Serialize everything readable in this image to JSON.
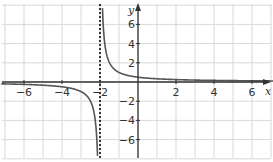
{
  "chart_data": {
    "type": "line",
    "title": "",
    "xlabel": "x",
    "ylabel": "y",
    "xlim": [
      -7,
      7
    ],
    "ylim": [
      -8,
      8
    ],
    "grid": true,
    "x_ticks": [
      -6,
      -4,
      -2,
      2,
      4,
      6
    ],
    "y_ticks": [
      -6,
      -4,
      -2,
      2,
      4,
      6
    ],
    "x_tick_labels": [
      "−6",
      "−4",
      "−2",
      "2",
      "4",
      "6"
    ],
    "y_tick_labels": [
      "−6",
      "−4",
      "−2",
      "2",
      "4",
      "6"
    ],
    "series": [
      {
        "name": "y = 1/(x+2)",
        "function": "1/(x+2)",
        "branch_left": {
          "x": [
            -7,
            -6,
            -5,
            -4,
            -3,
            -2.5,
            -2.2,
            -2.125
          ],
          "y": [
            -0.2,
            -0.25,
            -0.33,
            -0.5,
            -1,
            -2,
            -5,
            -8
          ]
        },
        "branch_right": {
          "x": [
            -1.875,
            -1.8,
            -1.5,
            -1,
            0,
            2,
            4,
            6,
            7
          ],
          "y": [
            8,
            5,
            2,
            1,
            0.5,
            0.25,
            0.17,
            0.125,
            0.11
          ]
        }
      }
    ],
    "asymptotes": [
      {
        "type": "vertical",
        "x": -2,
        "style": "dotted"
      },
      {
        "type": "horizontal",
        "y": 0
      }
    ],
    "colors": {
      "curve": "#555555",
      "axis": "#333333",
      "grid": "#d8d8d8",
      "asymptote": "#222222"
    }
  }
}
